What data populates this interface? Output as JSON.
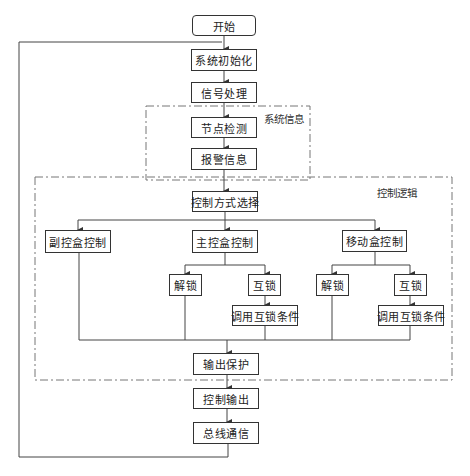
{
  "diagram": {
    "type": "flowchart",
    "nodes": {
      "start": "开始",
      "init": "系统初始化",
      "signal": "信号处理",
      "node_detect": "节点检测",
      "alarm": "报警信息",
      "mode_select": "控制方式选择",
      "sub_box": "副控盒控制",
      "main_box": "主控盒控制",
      "mobile_box": "移动盒控制",
      "main_unlock": "解锁",
      "main_interlock": "互锁",
      "main_call_interlock": "调用互锁条件",
      "mobile_unlock": "解锁",
      "mobile_interlock": "互锁",
      "mobile_call_interlock": "调用互锁条件",
      "output_protect": "输出保护",
      "control_output": "控制输出",
      "bus_comm": "总线通信"
    },
    "groups": {
      "system_info": "系统信息",
      "control_logic": "控制逻辑"
    },
    "edges": [
      [
        "开始",
        "系统初始化"
      ],
      [
        "系统初始化",
        "信号处理"
      ],
      [
        "信号处理",
        "节点检测"
      ],
      [
        "节点检测",
        "报警信息"
      ],
      [
        "报警信息",
        "控制方式选择"
      ],
      [
        "控制方式选择",
        "副控盒控制"
      ],
      [
        "控制方式选择",
        "主控盒控制"
      ],
      [
        "控制方式选择",
        "移动盒控制"
      ],
      [
        "主控盒控制",
        "解锁"
      ],
      [
        "主控盒控制",
        "互锁"
      ],
      [
        "互锁",
        "调用互锁条件"
      ],
      [
        "移动盒控制",
        "解锁"
      ],
      [
        "移动盒控制",
        "互锁"
      ],
      [
        "互锁",
        "调用互锁条件"
      ],
      [
        "branches merge",
        "输出保护"
      ],
      [
        "输出保护",
        "控制输出"
      ],
      [
        "控制输出",
        "总线通信"
      ],
      [
        "总线通信",
        "系统初始化 (loop)"
      ]
    ]
  }
}
